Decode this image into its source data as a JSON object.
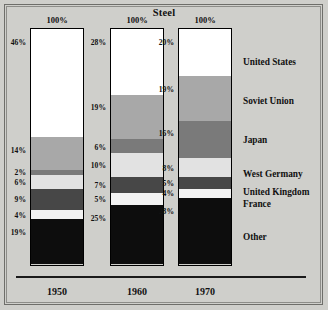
{
  "chart_data": {
    "type": "bar",
    "subtype": "stacked-100-percent",
    "title": "Steel",
    "xlabel": "",
    "ylabel": "",
    "ylim": [
      0,
      100
    ],
    "grid": false,
    "legend_position": "right",
    "value_suffix": "%",
    "categories": [
      "1950",
      "1960",
      "1970"
    ],
    "column_totals": [
      "100%",
      "100%",
      "100%"
    ],
    "series": [
      {
        "name": "United States",
        "color": "#ffffff",
        "values": [
          46,
          28,
          20
        ]
      },
      {
        "name": "Soviet Union",
        "color": "#a8a8a8",
        "values": [
          14,
          19,
          19
        ]
      },
      {
        "name": "Japan",
        "color": "#7a7a7a",
        "values": [
          2,
          6,
          16
        ]
      },
      {
        "name": "West Germany",
        "color": "#e2e2e2",
        "values": [
          6,
          10,
          8
        ]
      },
      {
        "name": "United Kingdom",
        "color": "#474747",
        "values": [
          9,
          7,
          5
        ]
      },
      {
        "name": "France",
        "color": "#f2f2f2",
        "values": [
          4,
          5,
          4
        ]
      },
      {
        "name": "Other",
        "color": "#0d0d0d",
        "values": [
          19,
          25,
          28
        ]
      }
    ],
    "tick_labels": {
      "1950": [
        "46%",
        "14%",
        "2%",
        "6%",
        "9%",
        "4%",
        "19%"
      ],
      "1960": [
        "28%",
        "19%",
        "6%",
        "10%",
        "7%",
        "5%",
        "25%"
      ],
      "1970": [
        "20%",
        "19%",
        "16%",
        "8%",
        "5%",
        "4%",
        "28%"
      ]
    }
  },
  "legend": {
    "items": [
      {
        "label": "United States"
      },
      {
        "label": "Soviet Union"
      },
      {
        "label": "Japan"
      },
      {
        "label": "West Germany"
      },
      {
        "label": "United Kingdom"
      },
      {
        "label": "France"
      },
      {
        "label": "Other"
      }
    ]
  },
  "colors": {
    "background": "#cfcfcb",
    "frame": "#6e6e6a",
    "axis": "#1a1a1a",
    "text": "#111111"
  }
}
